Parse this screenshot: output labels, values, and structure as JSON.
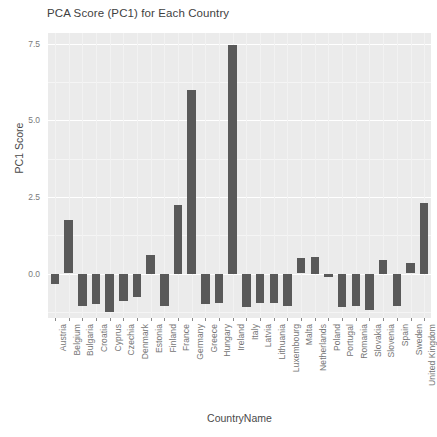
{
  "chart_data": {
    "type": "bar",
    "title": "PCA Score (PC1) for Each Country",
    "xlabel": "CountryName",
    "ylabel": "PC1 Score",
    "categories": [
      "Austria",
      "Belgium",
      "Bulgaria",
      "Croatia",
      "Cyprus",
      "Czechia",
      "Denmark",
      "Estonia",
      "Finland",
      "France",
      "Germany",
      "Greece",
      "Hungary",
      "Ireland",
      "Italy",
      "Latvia",
      "Lithuania",
      "Luxembourg",
      "Malta",
      "Netherlands",
      "Poland",
      "Portugal",
      "Romania",
      "Slovakia",
      "Slovenia",
      "Spain",
      "Sweden",
      "United Kingdom"
    ],
    "values": [
      -0.35,
      1.75,
      -1.05,
      -1.0,
      -1.25,
      -0.9,
      -0.75,
      0.6,
      -1.05,
      2.25,
      6.0,
      -1.0,
      -0.95,
      7.45,
      -1.1,
      -0.95,
      -0.95,
      -1.05,
      0.5,
      0.55,
      -0.1,
      -1.1,
      -1.05,
      -1.2,
      0.45,
      -1.05,
      0.35,
      2.3
    ],
    "ylim": [
      -1.45,
      7.85
    ],
    "yticks": [
      0.0,
      2.5,
      5.0,
      7.5
    ],
    "ytick_labels": [
      "0.0",
      "2.5",
      "5.0",
      "7.5"
    ],
    "grid": true,
    "legend": "none",
    "bar_color": "#595959",
    "panel_color": "#ebebeb"
  }
}
